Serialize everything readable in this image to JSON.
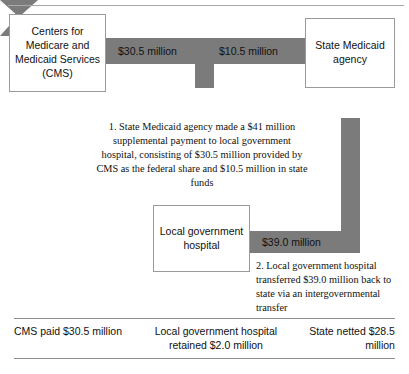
{
  "diagram": {
    "boxes": {
      "cms": "Centers for Medicare and Medicaid Services (CMS)",
      "state_agency": "State Medicaid agency",
      "hospital": "Local government hospital"
    },
    "flow_labels": {
      "federal_share": "$30.5 million",
      "state_share": "$10.5 million",
      "transfer_back": "$39.0 million"
    },
    "notes": {
      "step_1": "1. State Medicaid agency made a $41 million supplemental payment to local government hospital, consisting of $30.5 million provided by CMS as the federal share and $10.5 million in state funds",
      "step_2": "2. Local government hospital transferred $39.0 million back to state via an intergovernmental transfer"
    }
  },
  "summary": {
    "cms_paid": "CMS paid $30.5 million",
    "hospital_retained": "Local government hospital retained $2.0 million",
    "state_netted": "State netted $28.5 million"
  },
  "colors": {
    "arrow_gray": "#7b7b7b",
    "box_border": "#9a9a9a",
    "rule": "#8d8d8d"
  }
}
